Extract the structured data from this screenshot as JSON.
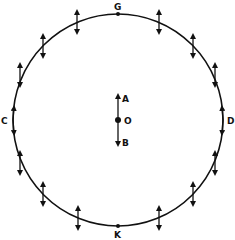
{
  "diagram": {
    "center": {
      "x": 118,
      "y": 120
    },
    "radius_x": 105,
    "radius_y": 106,
    "stroke_color": "#111111",
    "labels": {
      "G": "G",
      "K": "K",
      "C": "C",
      "D": "D",
      "O": "O",
      "A": "A",
      "B": "B"
    },
    "points": {
      "G": {
        "x": 118,
        "y": 14
      },
      "K": {
        "x": 118,
        "y": 226
      },
      "C": {
        "x": 13,
        "y": 120
      },
      "D": {
        "x": 223,
        "y": 120
      },
      "O": {
        "x": 118,
        "y": 120
      }
    },
    "center_arrows": {
      "up_to": "A",
      "down_to": "B"
    },
    "perimeter_arrows": [
      {
        "x": 77,
        "y": 22
      },
      {
        "x": 43,
        "y": 46
      },
      {
        "x": 20,
        "y": 75
      },
      {
        "x": 159,
        "y": 22
      },
      {
        "x": 193,
        "y": 46
      },
      {
        "x": 215,
        "y": 75
      },
      {
        "x": 20,
        "y": 163
      },
      {
        "x": 43,
        "y": 194
      },
      {
        "x": 78,
        "y": 218
      },
      {
        "x": 215,
        "y": 163
      },
      {
        "x": 193,
        "y": 194
      },
      {
        "x": 159,
        "y": 218
      }
    ]
  }
}
